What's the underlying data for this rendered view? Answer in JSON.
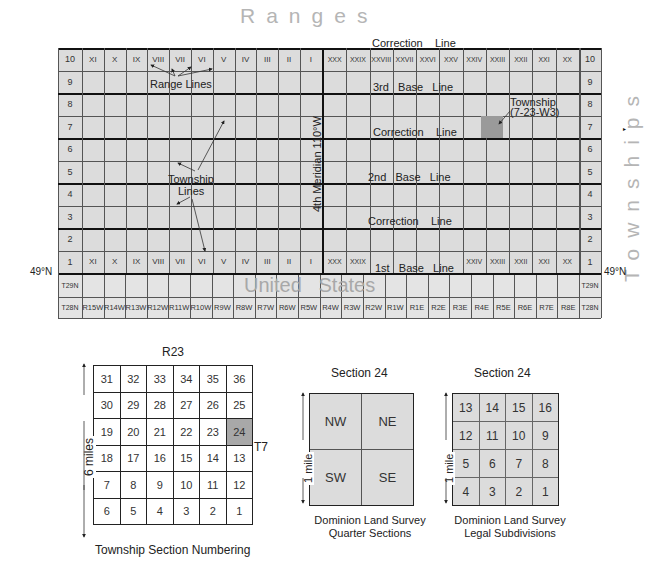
{
  "title_ranges": "Ranges",
  "title_townships": "Townships",
  "latitude_label": "49°N",
  "meridian_label": "4th Meridian 110°W",
  "main_map": {
    "west_ranges": [
      "XI",
      "X",
      "IX",
      "VIII",
      "VII",
      "VI",
      "V",
      "IV",
      "III",
      "II",
      "I"
    ],
    "east_ranges": [
      "XXX",
      "XXIX",
      "XXVIII",
      "XXVII",
      "XXVI",
      "XXV",
      "XXIV",
      "XXIII",
      "XXII",
      "XXI",
      "XX"
    ],
    "bottom_east_ranges": [
      "XXX",
      "XXIX",
      "",
      "",
      "",
      "",
      "XXIV",
      "XXIII",
      "XXII",
      "XXI",
      "XX"
    ],
    "township_rows": [
      "10",
      "9",
      "8",
      "7",
      "6",
      "5",
      "4",
      "3",
      "2",
      "1"
    ],
    "annotations": {
      "range_lines": "Range Lines",
      "township_lines": "Township Lines",
      "township_line1": "Township",
      "township_line2": "Lines",
      "township_callout1": "Township",
      "township_callout2": "(7-23-W3)",
      "top_correction": "Correction    Line",
      "third_base": "3rd   Base   Line",
      "correction_upper": "Correction    Line",
      "second_base": "2nd   Base   Line",
      "correction_lower": "Correction    Line",
      "first_base": "1st   Base   Line"
    },
    "highlighted_township": {
      "township": 7,
      "range": "XXIII",
      "color": "#9a9a9a"
    }
  },
  "us_strip": {
    "label": "United   States",
    "row_labels": [
      "T29N",
      "T28N"
    ],
    "ranges": [
      "R15W",
      "R14W",
      "R13W",
      "R12W",
      "R11W",
      "R10W",
      "R9W",
      "R8W",
      "R7W",
      "R6W",
      "R5W",
      "R4W",
      "R3W",
      "R2W",
      "R1W",
      "R1E",
      "R2E",
      "R3E",
      "R4E",
      "R5E",
      "R6E",
      "R7E",
      "R8E"
    ]
  },
  "township_sections": {
    "range_label": "R23",
    "township_label": "T7",
    "side_label": "6 miles",
    "caption": "Township Section Numbering",
    "rows": [
      [
        "31",
        "32",
        "33",
        "34",
        "35",
        "36"
      ],
      [
        "30",
        "29",
        "28",
        "27",
        "26",
        "25"
      ],
      [
        "19",
        "20",
        "21",
        "22",
        "23",
        "24"
      ],
      [
        "18",
        "17",
        "16",
        "15",
        "14",
        "13"
      ],
      [
        "7",
        "8",
        "9",
        "10",
        "11",
        "12"
      ],
      [
        "6",
        "5",
        "4",
        "3",
        "2",
        "1"
      ]
    ],
    "highlighted": "24"
  },
  "quarter_sections": {
    "title": "Section  24",
    "side_label": "1 mile",
    "cells": [
      "NW",
      "NE",
      "SW",
      "SE"
    ],
    "caption1": "Dominion Land Survey",
    "caption2": "Quarter Sections"
  },
  "legal_subdivisions": {
    "title": "Section  24",
    "side_label": "1 mile",
    "rows": [
      [
        "13",
        "14",
        "15",
        "16"
      ],
      [
        "12",
        "11",
        "10",
        "9"
      ],
      [
        "5",
        "6",
        "7",
        "8"
      ],
      [
        "4",
        "3",
        "2",
        "1"
      ]
    ],
    "caption1": "Dominion Land Survey",
    "caption2": "Legal Subdivisions"
  }
}
